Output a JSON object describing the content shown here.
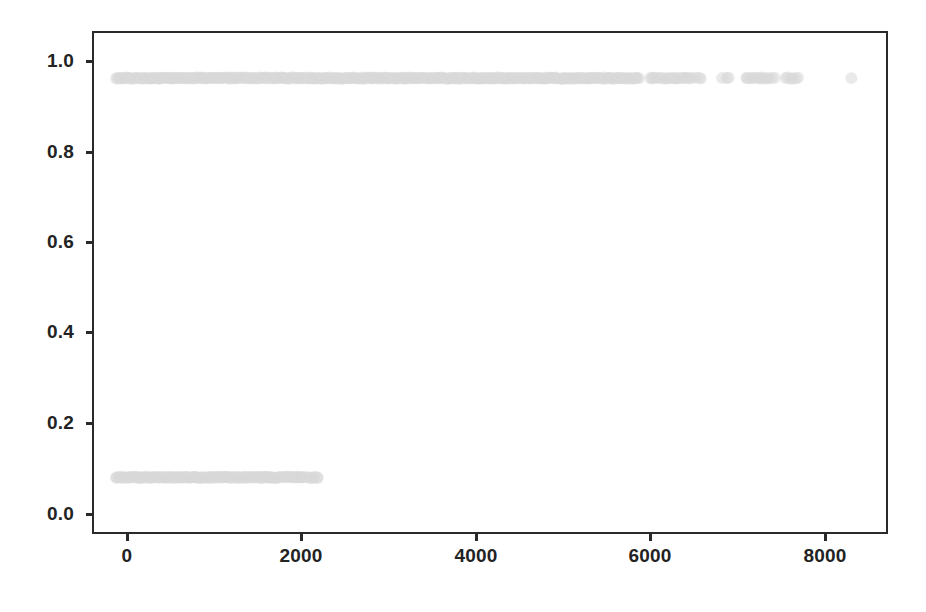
{
  "chart_data": {
    "type": "scatter",
    "title": "",
    "subtitle": "",
    "xlabel": "",
    "ylabel": "",
    "xlim": [
      -310,
      8730
    ],
    "ylim": [
      -0.137,
      1.113
    ],
    "xticks": [
      0,
      2000,
      4000,
      6000,
      8000
    ],
    "xtick_labels": [
      "0",
      "2000",
      "4000",
      "6000",
      "8000"
    ],
    "yticks": [
      0.0,
      0.2,
      0.4,
      0.6,
      0.8,
      1.0
    ],
    "ytick_labels": [
      "0.0",
      "0.2",
      "0.4",
      "0.6",
      "0.8",
      "1.0"
    ],
    "grid": false,
    "legend": null,
    "legend_position": "none",
    "annotations": [],
    "marker": {
      "shape": "circle",
      "diameter_px": 12,
      "color": "#d8d8d8",
      "edge_color": "#d8d8d8",
      "alpha": 0.55
    },
    "series": [
      {
        "name": "y = 1",
        "y_value": 1.0,
        "count": 420,
        "x_ranges": [
          {
            "from": -60,
            "to": 5910,
            "density": "dense-continuous",
            "n": 360
          },
          {
            "from": 6030,
            "to": 6520,
            "density": "cluster",
            "n": 22
          },
          {
            "from": 6560,
            "to": 6620,
            "density": "cluster",
            "n": 3
          },
          {
            "from": 6860,
            "to": 6940,
            "density": "isolated",
            "n": 3
          },
          {
            "from": 7130,
            "to": 7300,
            "density": "cluster",
            "n": 8
          },
          {
            "from": 7320,
            "to": 7450,
            "density": "cluster",
            "n": 6
          },
          {
            "from": 7590,
            "to": 7720,
            "density": "cluster",
            "n": 6
          },
          {
            "from": 8310,
            "to": 8400,
            "density": "isolated",
            "n": 1
          }
        ]
      },
      {
        "name": "y = 0",
        "y_value": 0.0,
        "count": 160,
        "x_ranges": [
          {
            "from": -60,
            "to": 1820,
            "density": "dense-continuous",
            "n": 132
          },
          {
            "from": 1850,
            "to": 1960,
            "density": "cluster",
            "n": 8
          },
          {
            "from": 1990,
            "to": 2080,
            "density": "cluster",
            "n": 8
          },
          {
            "from": 2120,
            "to": 2250,
            "density": "cluster",
            "n": 8
          }
        ]
      }
    ]
  },
  "axes": {
    "frame_color": "#2a2a2a",
    "background_color": "#ffffff",
    "tick_label_color": "#232323"
  }
}
